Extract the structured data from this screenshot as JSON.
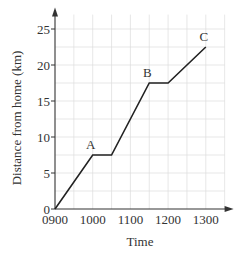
{
  "chart_data": {
    "type": "line",
    "title": "",
    "xlabel": "Time",
    "ylabel": "Distance from home (km)",
    "x_ticks": [
      "0900",
      "1000",
      "1100",
      "1200",
      "1300"
    ],
    "y_ticks": [
      0,
      5,
      10,
      15,
      20,
      25
    ],
    "xlim": [
      "0900",
      "1330"
    ],
    "ylim": [
      0,
      27
    ],
    "grid": true,
    "grid_x_step_minutes": 30,
    "grid_y_step_km": 2.5,
    "series": [
      {
        "name": "Journey",
        "x": [
          "0900",
          "1000",
          "1030",
          "1130",
          "1200",
          "1300"
        ],
        "x_hours": [
          9.0,
          10.0,
          10.5,
          11.5,
          12.0,
          13.0
        ],
        "y": [
          0,
          7.5,
          7.5,
          17.5,
          17.5,
          22.5
        ]
      }
    ],
    "annotations": [
      {
        "label": "A",
        "x": "1000",
        "y": 7.5
      },
      {
        "label": "B",
        "x": "1130",
        "y": 17.5
      },
      {
        "label": "C",
        "x": "1300",
        "y": 22.5
      }
    ],
    "colors": {
      "line": "#222222",
      "grid": "#dcdcdc",
      "axis": "#333333"
    }
  }
}
